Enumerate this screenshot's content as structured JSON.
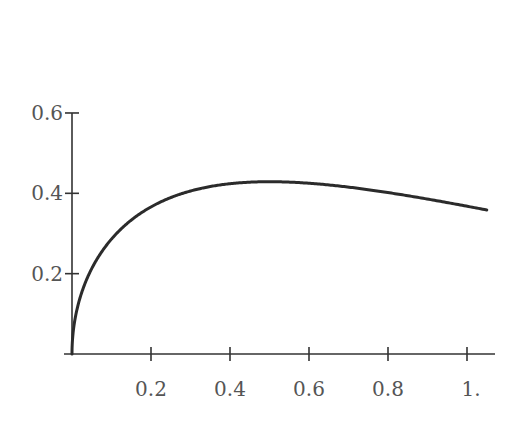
{
  "chart_data": {
    "type": "line",
    "title": "",
    "xlabel": "",
    "ylabel": "",
    "function": "sqrt(x)*exp(-x)",
    "xlim": [
      0,
      1.06
    ],
    "ylim": [
      0,
      0.6
    ],
    "grid": false,
    "legend": null,
    "x_ticks": [
      0.2,
      0.4,
      0.6,
      0.8,
      1.0
    ],
    "x_tick_labels": [
      "0.2",
      "0.4",
      "0.6",
      "0.8",
      "1."
    ],
    "y_ticks": [
      0.2,
      0.4,
      0.6
    ],
    "y_tick_labels": [
      "0.2",
      "0.4",
      "0.6"
    ],
    "series": [
      {
        "name": "curve",
        "color": "#2b2b2b",
        "x": [
          0,
          0.01,
          0.05,
          0.1,
          0.2,
          0.3,
          0.4,
          0.5,
          0.6,
          0.7,
          0.8,
          0.9,
          1.0,
          1.05
        ],
        "y": [
          0,
          0.099,
          0.213,
          0.286,
          0.366,
          0.406,
          0.424,
          0.429,
          0.425,
          0.415,
          0.402,
          0.386,
          0.368,
          0.358
        ]
      }
    ]
  }
}
